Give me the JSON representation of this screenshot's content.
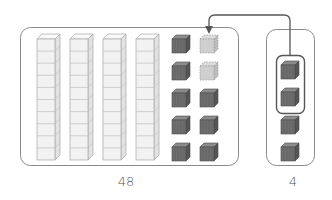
{
  "diagram": {
    "type": "base-ten-blocks-regrouping",
    "colors": {
      "box_stroke": "#8a8a8a",
      "rod_face": "#f2f2f2",
      "rod_stroke": "#b0b0b0",
      "cube_front": "#6e6e6e",
      "cube_top": "#8c8c8c",
      "cube_side": "#555555",
      "ghost_cube": "#c8c8c8",
      "arrow": "#555555"
    },
    "left_group": {
      "label": "48",
      "tens_rods": 4,
      "units_cubes": 8,
      "ghost_cubes": 2
    },
    "right_group": {
      "label": "4",
      "units_cubes": 4,
      "circled_cubes": 2
    },
    "arrow": {
      "from": "right-group-circled-cubes",
      "to": "left-group-ghost-cubes"
    }
  }
}
